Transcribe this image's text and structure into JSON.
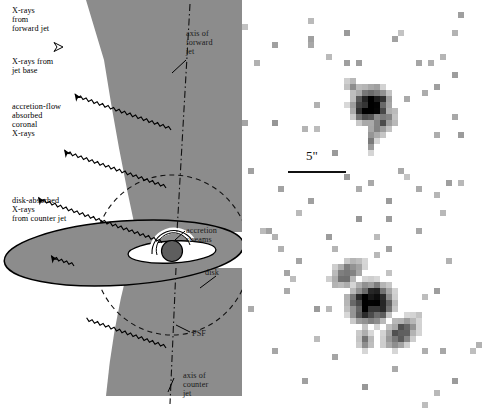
{
  "figure": {
    "background_color": "#ffffff"
  },
  "left_panel": {
    "name": "jet-geometry-schematic",
    "colors": {
      "cone_gray": "#8c8c8c",
      "disk_gray": "#8c8c8c",
      "black_hole": "#5e5e5e",
      "outline": "#000000",
      "inner_disk_white": "#ffffff"
    },
    "labels": {
      "forward_jet_xrays": "X-rays\nfrom\nforward jet",
      "jet_base_xrays": "X-rays from\njet base",
      "coronal_xrays": "accretion-flow\nabsorbed\ncoronal\nX-rays",
      "counter_jet_xrays": "disk-absorbed\nX-rays\nfrom counter jet",
      "axis_forward": "axis of\nforward\njet",
      "axis_counter": "axis of\ncounter\njet",
      "accretion_streams": "accretion\nstreams",
      "disk": "disk",
      "psf": "PSF"
    }
  },
  "right_panel": {
    "name": "xray-image-panel",
    "scale_bar": {
      "label": "5\"",
      "length_px": 56,
      "units": "arcseconds"
    },
    "colors": {
      "background": "#ffffff",
      "faint_pixel": "#b4b4b4",
      "mid_pixel": "#787878",
      "dark_pixel": "#303030",
      "core_pixel": "#000000"
    },
    "sources": [
      {
        "name": "upper-source",
        "center_x": 124,
        "center_y": 101
      },
      {
        "name": "lower-source",
        "center_x": 128,
        "center_y": 300
      }
    ]
  },
  "chart_data": {
    "type": "heatmap",
    "xlabel": "",
    "ylabel": "",
    "scale_bar_label": "5\"",
    "cell_size_px": 6,
    "colormap": "grayscale-inverted",
    "noise_pixels": [
      [
        32,
        42,
        1
      ],
      [
        66,
        38,
        1
      ],
      [
        12,
        62,
        1
      ],
      [
        102,
        30,
        1
      ],
      [
        152,
        38,
        1
      ],
      [
        186,
        58,
        1
      ],
      [
        72,
        102,
        1
      ],
      [
        102,
        62,
        1
      ],
      [
        178,
        92,
        1
      ],
      [
        212,
        72,
        1
      ],
      [
        30,
        118,
        1
      ],
      [
        60,
        128,
        1
      ],
      [
        90,
        148,
        1
      ],
      [
        128,
        182,
        1
      ],
      [
        156,
        168,
        1
      ],
      [
        190,
        130,
        1
      ],
      [
        210,
        112,
        1
      ],
      [
        36,
        186,
        1
      ],
      [
        66,
        196,
        1
      ],
      [
        100,
        176,
        1
      ],
      [
        146,
        196,
        1
      ],
      [
        176,
        188,
        1
      ],
      [
        206,
        178,
        1
      ],
      [
        24,
        226,
        1
      ],
      [
        54,
        256,
        1
      ],
      [
        84,
        236,
        1
      ],
      [
        114,
        216,
        1
      ],
      [
        144,
        246,
        1
      ],
      [
        174,
        226,
        1
      ],
      [
        204,
        256,
        1
      ],
      [
        40,
        286,
        1
      ],
      [
        70,
        306,
        1
      ],
      [
        100,
        296,
        1
      ],
      [
        160,
        316,
        1
      ],
      [
        190,
        286,
        1
      ],
      [
        28,
        346,
        1
      ],
      [
        58,
        376,
        1
      ],
      [
        88,
        356,
        1
      ],
      [
        118,
        386,
        1
      ],
      [
        148,
        366,
        1
      ],
      [
        178,
        346,
        1
      ],
      [
        208,
        376,
        1
      ]
    ],
    "upper_source": {
      "core": [
        [
          118,
          92
        ],
        [
          124,
          92
        ],
        [
          118,
          98
        ],
        [
          124,
          98
        ],
        [
          112,
          98
        ],
        [
          130,
          92
        ]
      ],
      "peak_value": 1.0,
      "extent_px": 40
    },
    "lower_source": {
      "core": [
        [
          120,
          288
        ],
        [
          126,
          288
        ],
        [
          120,
          294
        ],
        [
          126,
          294
        ],
        [
          132,
          294
        ],
        [
          114,
          294
        ]
      ],
      "peak_value": 1.0,
      "extent_px": 56,
      "extensions": [
        "northwest-plume",
        "southeast-plume"
      ]
    }
  }
}
